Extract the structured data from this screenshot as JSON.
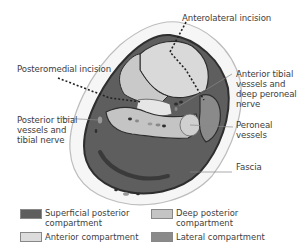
{
  "diagram": {
    "labels": {
      "anterolateral_incision": "Anterolateral incision",
      "posteromedial_incision": "Posteromedial incision",
      "anterior_tibial_line1": "Anterior tibial",
      "anterior_tibial_line2": "vessels and",
      "anterior_tibial_line3": "deep peroneal",
      "anterior_tibial_line4": "nerve",
      "posterior_tibial_line1": "Posterior tibial",
      "posterior_tibial_line2": "vessels and",
      "posterior_tibial_line3": "tibial nerve",
      "peroneal_line1": "Peroneal",
      "peroneal_line2": "vessels",
      "fascia": "Fascia"
    },
    "colors": {
      "superficial_posterior": "#5e5e5e",
      "anterior": "#d9d9d9",
      "deep_posterior": "#c4c4c4",
      "lateral": "#8a8a8a",
      "skin": "#f4f4f4",
      "outline": "#2e2e2e"
    }
  },
  "legend": {
    "items": [
      {
        "line1": "Superficial posterior",
        "line2": "compartment",
        "color": "#5e5e5e"
      },
      {
        "line1": "Deep posterior",
        "line2": "compartment",
        "color": "#c4c4c4"
      },
      {
        "line1": "Anterior compartment",
        "line2": "",
        "color": "#dcdcdc"
      },
      {
        "line1": "Lateral compartment",
        "line2": "",
        "color": "#8a8a8a"
      }
    ]
  }
}
